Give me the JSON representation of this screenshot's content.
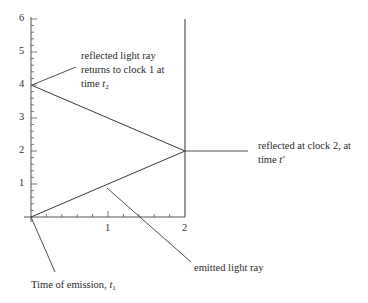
{
  "diagram": {
    "type": "spacetime-diagram",
    "axes": {
      "x": {
        "min": 0,
        "max": 2,
        "major_ticks": [
          1,
          2
        ],
        "minor_step": 0.2,
        "tick_labels": [
          "1",
          "2"
        ]
      },
      "y": {
        "min": 0,
        "max": 6,
        "major_ticks": [
          1,
          2,
          3,
          4,
          5,
          6
        ],
        "minor_step": 0.2,
        "tick_labels": [
          "1",
          "2",
          "3",
          "4",
          "5",
          "6"
        ]
      }
    },
    "worldlines": [
      {
        "name": "clock 1",
        "x": 0
      },
      {
        "name": "clock 2",
        "x": 2
      }
    ],
    "rays": [
      {
        "name": "emitted light ray",
        "from": [
          0,
          0
        ],
        "to": [
          2,
          2
        ]
      },
      {
        "name": "reflected light ray",
        "from": [
          2,
          2
        ],
        "to": [
          0,
          4
        ]
      }
    ],
    "annotations": {
      "return": {
        "line1": "reflected light ray",
        "line2": "returns to clock 1 at",
        "line3_prefix": "time ",
        "line3_var": "t",
        "line3_sub": "2"
      },
      "reflect": {
        "line1": "reflected at clock 2, at",
        "line2_prefix": "time ",
        "line2_var": "t′"
      },
      "emitted": {
        "text": "emitted light ray"
      },
      "emission": {
        "prefix": "Time of emission, ",
        "var": "t",
        "sub": "1"
      }
    },
    "colors": {
      "line": "#3a3a3a",
      "axis": "#555555",
      "text": "#2a2a2a"
    }
  }
}
